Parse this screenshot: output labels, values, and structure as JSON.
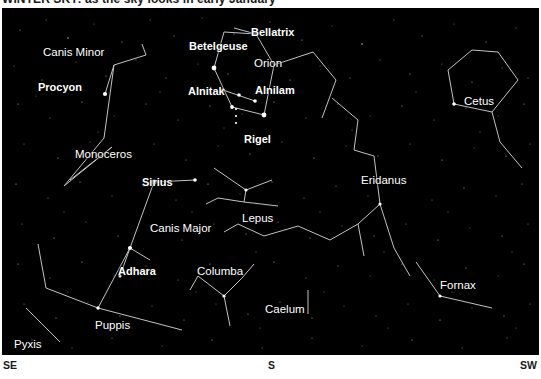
{
  "caption": {
    "text": "WINTER SKY: as the sky looks in early January"
  },
  "chart": {
    "background_color": "#000000",
    "line_color": "#d8d8d8",
    "star_color": "#ffffff",
    "label_color": "#ffffff"
  },
  "compass": {
    "left": "SE",
    "center": "S",
    "right": "SW"
  },
  "star_labels": [
    {
      "name": "Procyon",
      "x": 36,
      "y": 74
    },
    {
      "name": "Betelgeuse",
      "x": 187,
      "y": 33
    },
    {
      "name": "Bellatrix",
      "x": 249,
      "y": 19
    },
    {
      "name": "Alnitak",
      "x": 186,
      "y": 78
    },
    {
      "name": "Alnilam",
      "x": 253,
      "y": 77
    },
    {
      "name": "Rigel",
      "x": 242,
      "y": 126
    },
    {
      "name": "Sirius",
      "x": 140,
      "y": 169
    },
    {
      "name": "Adhara",
      "x": 116,
      "y": 258
    }
  ],
  "constellation_labels": [
    {
      "name": "Canis Minor",
      "x": 41,
      "y": 39
    },
    {
      "name": "Orion",
      "x": 252,
      "y": 50
    },
    {
      "name": "Monoceros",
      "x": 73,
      "y": 141
    },
    {
      "name": "Canis Major",
      "x": 148,
      "y": 215
    },
    {
      "name": "Lepus",
      "x": 240,
      "y": 205
    },
    {
      "name": "Columba",
      "x": 195,
      "y": 258
    },
    {
      "name": "Caelum",
      "x": 263,
      "y": 296
    },
    {
      "name": "Eridanus",
      "x": 359,
      "y": 167
    },
    {
      "name": "Cetus",
      "x": 462,
      "y": 88
    },
    {
      "name": "Fornax",
      "x": 438,
      "y": 272
    },
    {
      "name": "Puppis",
      "x": 93,
      "y": 312
    },
    {
      "name": "Pyxis",
      "x": 12,
      "y": 331
    }
  ]
}
